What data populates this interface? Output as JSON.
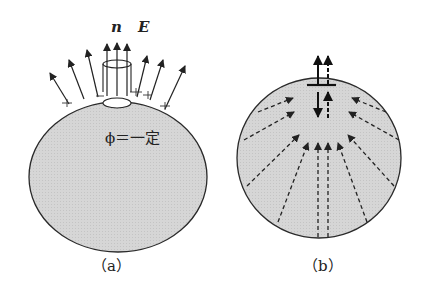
{
  "figure_a": {
    "label": "（a）",
    "vector_labels": {
      "normal": "n",
      "field": "E"
    },
    "surface_label": "ϕ＝一定",
    "fill_color": "#d8d8d8",
    "stroke_color": "#2a2a2a"
  },
  "figure_b": {
    "label": "（b）",
    "fill_color": "#d8d8d8",
    "stroke_color": "#2a2a2a"
  }
}
